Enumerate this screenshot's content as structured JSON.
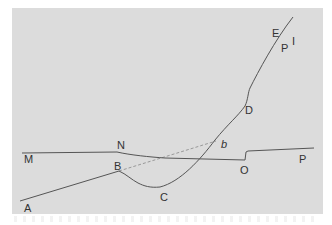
{
  "diagram": {
    "background": "#dcdcdc",
    "line_color": "#555555",
    "dashed_color": "#888888",
    "labels": {
      "A": "A",
      "B": "B",
      "C": "C",
      "D": "D",
      "E": "E",
      "P_upper": "P",
      "I": "I",
      "M": "M",
      "N": "N",
      "b": "b",
      "O": "O",
      "P_right": "P"
    },
    "curves": [
      {
        "id": "line-AB",
        "desc": "straight line from A to B"
      },
      {
        "id": "dashed-Bb",
        "desc": "dashed extension from B to b"
      },
      {
        "id": "curve-BCDE",
        "desc": "curve from B dipping to C, rising through D to E"
      },
      {
        "id": "line-MNOP",
        "desc": "near-horizontal line from M via N to O, step up, to P"
      }
    ]
  }
}
